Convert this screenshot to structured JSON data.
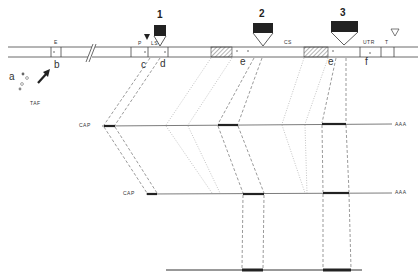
{
  "diagram": {
    "gene_regions": {
      "E": "E",
      "P": "P",
      "LS": "LS",
      "CS": "CS",
      "UTR": "UTR",
      "T": "T"
    },
    "site_letters": {
      "a": "a",
      "b": "b",
      "c": "c",
      "d": "d",
      "e1": "e",
      "e2": "e",
      "f": "f"
    },
    "insertion_numbers": [
      "1",
      "2",
      "3"
    ],
    "factor_label": "TAF",
    "transcripts": [
      {
        "cap": "CAP",
        "tail": "AAA"
      },
      {
        "cap": "CAP",
        "tail": "AAA"
      },
      {
        "cap": "",
        "tail": ""
      }
    ],
    "colors": {
      "line": "#333333",
      "box_fill": "#222222",
      "dash": "#555555"
    }
  }
}
